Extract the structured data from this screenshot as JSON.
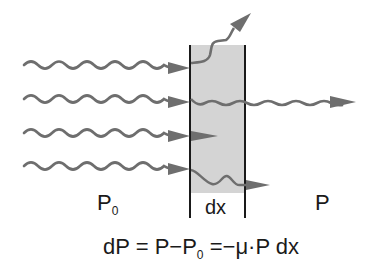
{
  "diagram": {
    "labels": {
      "incident_power": "P",
      "incident_power_sub": "0",
      "layer_thickness": "dx",
      "transmitted_power": "P"
    },
    "equation": {
      "lhs": "dP",
      "eq1": "=",
      "p": "P",
      "minus": "−",
      "p0": "P",
      "p0_sub": "0",
      "eq2": "=",
      "rhs": "−μ·P dx"
    },
    "rays": [
      {
        "name": "ray-scattered",
        "fate": "scattered out of layer (upward)"
      },
      {
        "name": "ray-transmitted",
        "fate": "passes through layer"
      },
      {
        "name": "ray-absorbed-1",
        "fate": "absorbed inside layer"
      },
      {
        "name": "ray-absorbed-2",
        "fate": "attenuated, exits layer weakly"
      }
    ],
    "colors": {
      "wave": "#6e6e6e",
      "slab_fill": "#d4d4d4",
      "slab_border": "#1a1a1a",
      "text": "#1a1a1a"
    }
  }
}
